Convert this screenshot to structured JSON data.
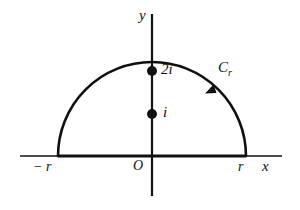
{
  "figure": {
    "background_color": "#ffffff",
    "ink_color": "#101010",
    "axes": {
      "x_axis_label": "x",
      "y_axis_label": "y",
      "origin_label": "O",
      "x_axis_line": {
        "x1": 20,
        "y1": 156,
        "x2": 282,
        "y2": 156
      },
      "y_axis_line": {
        "x1": 152,
        "y1": 14,
        "x2": 152,
        "y2": 196
      }
    },
    "contour": {
      "name_label": "C",
      "name_subscript": "r",
      "center_x": 152,
      "center_y": 156,
      "radius": 94,
      "diameter_segment": {
        "x1": 58,
        "y1": 156,
        "x2": 246,
        "y2": 156
      },
      "direction": "counterclockwise",
      "arrow_position_degrees": 45
    },
    "axis_ticks": [
      {
        "label": "− r",
        "x": 58,
        "y": 156
      },
      {
        "label": "r",
        "x": 246,
        "y": 156
      }
    ],
    "points": [
      {
        "label": "2i",
        "x": 152,
        "y": 71,
        "dot_radius": 5
      },
      {
        "label": "i",
        "x": 152,
        "y": 114,
        "dot_radius": 5
      }
    ]
  }
}
